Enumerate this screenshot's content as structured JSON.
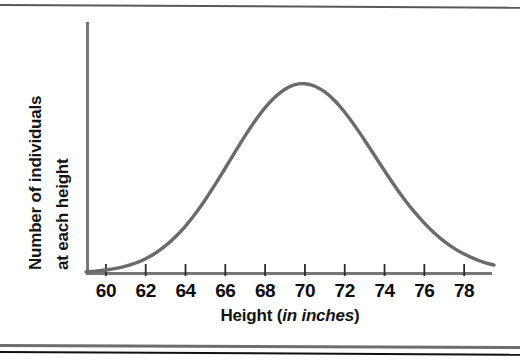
{
  "figure": {
    "kind": "textbook-figure",
    "caption_rules": [
      "page-rule-top",
      "page-rule-bottom-gray",
      "page-rule-bottom-dark"
    ]
  },
  "axes": {
    "ylabel_line1": "Number of individuals",
    "ylabel_line2": "at each height",
    "xlabel_prefix": "Height (",
    "xlabel_italic": "in inches",
    "xlabel_suffix": ")"
  },
  "colors": {
    "curve": "#6b6b6b",
    "axis": "#777777",
    "tick": "#2b2b2b",
    "text": "#0d0d0d",
    "rule_gray": "#6d6d6d",
    "rule_dark": "#111111",
    "background": "#ffffff"
  },
  "chart_data": {
    "type": "line",
    "title": "",
    "subtitle": "",
    "xlabel": "Height (in inches)",
    "ylabel": "Number of individuals at each height",
    "distribution": "normal",
    "mean": 69,
    "std_dev": 2.8,
    "peak_x": 69,
    "grid": false,
    "legend": null,
    "annotations": [],
    "xlim": [
      59,
      79.5
    ],
    "ylim": [
      0,
      1.08
    ],
    "xticks": [
      60,
      62,
      64,
      66,
      68,
      70,
      72,
      74,
      76,
      78
    ],
    "xticklabels": [
      "60",
      "62",
      "64",
      "66",
      "68",
      "70",
      "72",
      "74",
      "76",
      "78"
    ],
    "yticks": [],
    "yticklabels": [],
    "x": [
      59.0,
      59.5,
      60.0,
      60.5,
      61.0,
      61.5,
      62.0,
      62.5,
      63.0,
      63.5,
      64.0,
      64.5,
      65.0,
      65.5,
      66.0,
      66.5,
      67.0,
      67.5,
      68.0,
      68.5,
      69.0,
      69.5,
      70.0,
      70.5,
      71.0,
      71.5,
      72.0,
      72.5,
      73.0,
      73.5,
      74.0,
      74.5,
      75.0,
      75.5,
      76.0,
      76.5,
      77.0,
      77.5,
      78.0,
      78.5,
      79.0,
      79.5
    ],
    "y": [
      0.005,
      0.008,
      0.013,
      0.02,
      0.03,
      0.044,
      0.063,
      0.088,
      0.12,
      0.159,
      0.206,
      0.261,
      0.323,
      0.39,
      0.461,
      0.533,
      0.603,
      0.668,
      0.726,
      0.773,
      0.807,
      0.827,
      0.831,
      0.82,
      0.795,
      0.756,
      0.706,
      0.647,
      0.583,
      0.516,
      0.449,
      0.384,
      0.323,
      0.268,
      0.219,
      0.176,
      0.139,
      0.108,
      0.083,
      0.063,
      0.047,
      0.035
    ]
  }
}
